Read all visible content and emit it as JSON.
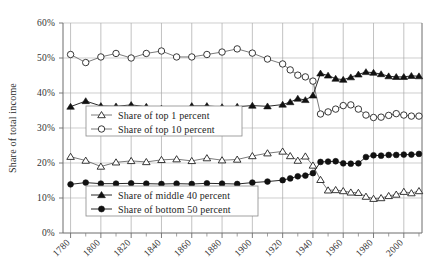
{
  "chart_data": {
    "type": "line",
    "title": "",
    "xlabel": "",
    "ylabel": "Share of total income",
    "xlim": [
      1775,
      2012
    ],
    "ylim": [
      0,
      60
    ],
    "grid": true,
    "legend_position": "inside-left",
    "y_ticks": [
      "0%",
      "10%",
      "20%",
      "30%",
      "40%",
      "50%",
      "60%"
    ],
    "y_tick_values": [
      0,
      10,
      20,
      30,
      40,
      50,
      60
    ],
    "x_ticks": [
      "1780",
      "1800",
      "1820",
      "1840",
      "1860",
      "1880",
      "1900",
      "1920",
      "1940",
      "1960",
      "1980",
      "2000"
    ],
    "x_tick_values": [
      1780,
      1800,
      1820,
      1840,
      1860,
      1880,
      1900,
      1920,
      1940,
      1960,
      1980,
      2000
    ],
    "x_minor_step": 10,
    "series": [
      {
        "name": "Share of top 1 percent",
        "marker": "open-triangle",
        "color": "#222222",
        "x": [
          1780,
          1790,
          1800,
          1810,
          1820,
          1830,
          1840,
          1850,
          1860,
          1870,
          1880,
          1890,
          1900,
          1910,
          1920,
          1925,
          1930,
          1935,
          1940,
          1945,
          1950,
          1955,
          1960,
          1965,
          1970,
          1975,
          1980,
          1985,
          1990,
          1995,
          2000,
          2005,
          2010
        ],
        "values": [
          21.8,
          20.7,
          19.0,
          20.2,
          20.6,
          20.3,
          20.9,
          21.1,
          20.6,
          21.4,
          20.8,
          21.0,
          22.0,
          22.8,
          23.3,
          22.0,
          20.7,
          21.9,
          19.3,
          15.2,
          12.2,
          12.3,
          12.0,
          11.6,
          11.5,
          10.4,
          9.8,
          10.0,
          10.6,
          11.0,
          11.8,
          11.4,
          12.0
        ]
      },
      {
        "name": "Share of top 10 percent",
        "marker": "open-circle",
        "color": "#222222",
        "x": [
          1780,
          1790,
          1800,
          1810,
          1820,
          1830,
          1840,
          1850,
          1860,
          1870,
          1880,
          1890,
          1900,
          1910,
          1920,
          1925,
          1930,
          1935,
          1940,
          1945,
          1950,
          1955,
          1960,
          1965,
          1970,
          1975,
          1980,
          1985,
          1990,
          1995,
          2000,
          2005,
          2010
        ],
        "values": [
          51.0,
          48.7,
          50.3,
          51.3,
          50.0,
          51.3,
          52.0,
          50.3,
          50.3,
          51.0,
          51.7,
          52.6,
          51.4,
          49.7,
          48.3,
          46.6,
          45.1,
          44.6,
          43.4,
          34.0,
          34.6,
          35.4,
          36.4,
          36.6,
          35.4,
          33.7,
          33.0,
          33.1,
          33.6,
          34.1,
          33.7,
          33.4,
          33.4
        ]
      },
      {
        "name": "Share of middle 40 percent",
        "marker": "solid-triangle",
        "color": "#111111",
        "x": [
          1780,
          1790,
          1800,
          1810,
          1820,
          1830,
          1840,
          1850,
          1860,
          1870,
          1880,
          1890,
          1900,
          1910,
          1920,
          1925,
          1930,
          1935,
          1940,
          1945,
          1950,
          1955,
          1960,
          1965,
          1970,
          1975,
          1980,
          1985,
          1990,
          1995,
          2000,
          2005,
          2010
        ],
        "values": [
          36.1,
          37.7,
          36.3,
          36.2,
          36.6,
          36.1,
          35.6,
          35.2,
          36.3,
          36.3,
          36.0,
          36.1,
          36.4,
          36.2,
          36.7,
          37.4,
          38.4,
          38.0,
          39.3,
          45.6,
          45.0,
          44.1,
          43.8,
          44.5,
          45.3,
          46.0,
          45.8,
          45.4,
          44.8,
          44.6,
          44.6,
          44.9,
          44.8
        ]
      },
      {
        "name": "Share of bottom 50 percent",
        "marker": "solid-circle",
        "color": "#111111",
        "x": [
          1780,
          1790,
          1800,
          1810,
          1820,
          1830,
          1840,
          1850,
          1860,
          1870,
          1880,
          1890,
          1900,
          1910,
          1920,
          1925,
          1930,
          1935,
          1940,
          1945,
          1950,
          1955,
          1960,
          1965,
          1970,
          1975,
          1980,
          1985,
          1990,
          1995,
          2000,
          2005,
          2010
        ],
        "values": [
          13.9,
          14.4,
          14.1,
          14.1,
          14.2,
          14.1,
          14.0,
          14.1,
          14.0,
          14.2,
          14.1,
          14.0,
          14.4,
          14.7,
          15.1,
          15.6,
          16.2,
          16.4,
          17.1,
          20.3,
          20.4,
          20.5,
          19.9,
          19.8,
          19.9,
          21.7,
          22.2,
          22.1,
          22.3,
          22.3,
          22.4,
          22.4,
          22.6
        ]
      }
    ],
    "legend_groups": [
      {
        "entries": [
          {
            "label": "Share of top 1 percent",
            "marker": "open-triangle"
          },
          {
            "label": "Share of top 10 percent",
            "marker": "open-circle"
          }
        ]
      },
      {
        "entries": [
          {
            "label": "Share of middle 40 percent",
            "marker": "solid-triangle"
          },
          {
            "label": "Share of bottom 50 percent",
            "marker": "solid-circle"
          }
        ]
      }
    ]
  }
}
